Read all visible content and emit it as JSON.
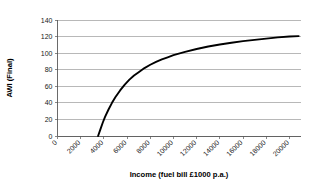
{
  "chart_data": {
    "type": "line",
    "title": "",
    "xlabel": "Income (fuel bill £1000 p.a.)",
    "ylabel": "AWI (Final)",
    "xlim": [
      0,
      21000
    ],
    "ylim": [
      0,
      140
    ],
    "grid": true,
    "legend": false,
    "legend_position": "none",
    "xticks": [
      0,
      2000,
      4000,
      6000,
      8000,
      10000,
      12000,
      14000,
      16000,
      18000,
      20000
    ],
    "xticklabels": [
      "0",
      "2000",
      "4000",
      "6000",
      "8000",
      "10000",
      "12000",
      "14000",
      "16000",
      "18000",
      "20000"
    ],
    "yticks": [
      0,
      20,
      40,
      60,
      80,
      100,
      120,
      140
    ],
    "yticklabels": [
      "0",
      "20",
      "40",
      "60",
      "80",
      "100",
      "120",
      "140"
    ],
    "series": [
      {
        "name": "AWI (Final)",
        "color": "#000000",
        "x": [
          3500,
          3700,
          3900,
          4100,
          4400,
          4700,
          5000,
          5400,
          5800,
          6200,
          6600,
          7000,
          7500,
          8000,
          8500,
          9000,
          9500,
          10000,
          11000,
          12000,
          13000,
          14000,
          15000,
          16000,
          17000,
          18000,
          19000,
          20000,
          20800
        ],
        "y": [
          0,
          8,
          16,
          23,
          32,
          40,
          47,
          55,
          62,
          68,
          73,
          77,
          82,
          86,
          89.5,
          92.5,
          95,
          97.5,
          101.5,
          105,
          108,
          110.5,
          112.5,
          114.5,
          116,
          117.5,
          119,
          120,
          120.5
        ]
      }
    ]
  },
  "axis_labels": {
    "x_title": "Income (fuel bill £1000 p.a.)",
    "y_title": "AWI (Final)"
  }
}
